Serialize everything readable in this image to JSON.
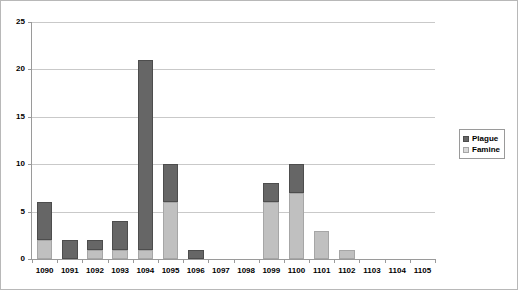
{
  "chart_data": {
    "type": "bar",
    "subtype": "stacked-column",
    "title": "",
    "xlabel": "",
    "ylabel": "",
    "ylim": [
      0,
      25
    ],
    "ytick_step": 5,
    "yticks": [
      0,
      5,
      10,
      15,
      20,
      25
    ],
    "ytick_labels": [
      "0",
      "5",
      "10",
      "15",
      "20",
      "25"
    ],
    "grid": true,
    "grid_axis": "y",
    "legend_position": "right",
    "categories": [
      "1090",
      "1091",
      "1092",
      "1093",
      "1094",
      "1095",
      "1096",
      "1097",
      "1098",
      "1099",
      "1100",
      "1101",
      "1102",
      "1103",
      "1104",
      "1105"
    ],
    "series": [
      {
        "name": "Famine",
        "color": "#c0c0c0",
        "values": [
          2,
          0,
          1,
          1,
          1,
          6,
          0,
          0,
          0,
          6,
          7,
          3,
          1,
          0,
          0,
          0
        ]
      },
      {
        "name": "Plague",
        "color": "#666666",
        "values": [
          4,
          2,
          1,
          3,
          20,
          4,
          1,
          0,
          0,
          2,
          3,
          0,
          0,
          0,
          0,
          0
        ]
      }
    ],
    "totals": [
      6,
      2,
      2,
      4,
      21,
      10,
      1,
      0,
      0,
      8,
      10,
      3,
      1,
      0,
      0,
      0
    ]
  },
  "legend": {
    "items": [
      {
        "label": "Plague",
        "swatch": "plague-swatch-icon"
      },
      {
        "label": "Famine",
        "swatch": "famine-swatch-icon"
      }
    ]
  },
  "colors": {
    "plague": "#666666",
    "famine": "#c0c0c0",
    "gridline": "#c9c9c9",
    "axis": "#9a9a9a",
    "border": "#b8b8b8",
    "background": "#ffffff"
  }
}
